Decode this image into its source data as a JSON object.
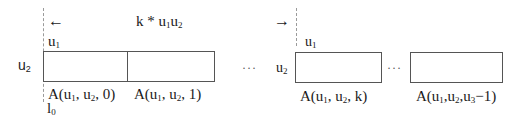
{
  "diagram": {
    "left_arrow": "←",
    "right_arrow": "→",
    "span_label": {
      "prefix": "k * u",
      "sub1": "1",
      "mid": "u",
      "sub2": "2"
    },
    "groups": [
      {
        "top_label": {
          "base": "u",
          "sub": "1"
        },
        "side_label": {
          "base": "u",
          "sub": "2"
        },
        "bottom_origin": {
          "base": "l",
          "sub": "0"
        }
      },
      {
        "top_label": {
          "base": "u",
          "sub": "1"
        },
        "side_label": {
          "base": "u",
          "sub": "2"
        }
      }
    ],
    "cells": [
      {
        "label_pre": "A(u",
        "s1": "1",
        "mid": ", u",
        "s2": "2",
        "post": ", 0)"
      },
      {
        "label_pre": "A(u",
        "s1": "1",
        "mid": ", u",
        "s2": "2",
        "post": ", 1)"
      },
      {
        "label_pre": "A(u",
        "s1": "1",
        "mid": ", u",
        "s2": "2",
        "post": ", k)"
      },
      {
        "label_pre": "A(u",
        "s1": "1",
        "mid": ",u",
        "s2": "2",
        "mid2": ",u",
        "s3": "3",
        "post": "−1)"
      }
    ],
    "ellipsis": "···"
  }
}
